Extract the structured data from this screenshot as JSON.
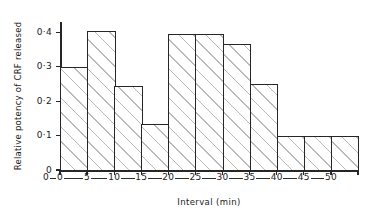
{
  "chart_data": {
    "type": "bar",
    "title": "",
    "subtitle": "",
    "xlabel": "Interval (min)",
    "ylabel": "Relative potency of CRF released",
    "categories": [
      "0-5",
      "5-10",
      "10-15",
      "15-20",
      "20-25",
      "25-30",
      "30-35",
      "35-40",
      "40-45",
      "45-50",
      "50-55"
    ],
    "bin_edges": [
      0,
      5,
      10,
      15,
      20,
      25,
      30,
      35,
      40,
      45,
      50
    ],
    "values": [
      0.3,
      0.405,
      0.245,
      0.135,
      0.395,
      0.395,
      0.365,
      0.25,
      0.1,
      0.1,
      0.1
    ],
    "ylim": [
      0,
      0.43
    ],
    "xlim": [
      0,
      11
    ],
    "ytick_values": [
      0.4,
      0.3,
      0.2,
      0.1,
      0
    ],
    "ytick_labels": [
      "0·4",
      "0·3",
      "0·2",
      "0·1",
      "0"
    ],
    "xtick_labels": [
      "0",
      "0",
      "5",
      "10",
      "15",
      "20",
      "25",
      "30",
      "35",
      "40",
      "45",
      "50"
    ],
    "grid": false,
    "legend": null,
    "legend_position": "none",
    "annotations": [],
    "style": {
      "bar_edge_color": "#262626",
      "bar_fill": "hatched-45deg",
      "hatch_color": "#b9b9b9",
      "background": "#ffffff",
      "axis_color": "#262626",
      "text_color": "#1a1a1a"
    }
  },
  "axes": {
    "y_title": "Relative potency of CRF released",
    "x_title": "Interval (min)"
  }
}
